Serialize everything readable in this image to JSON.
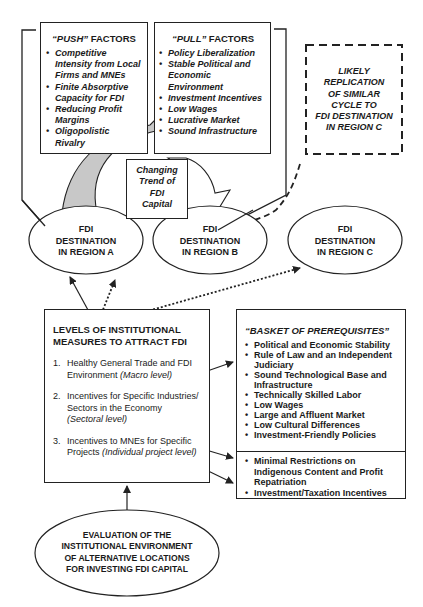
{
  "push": {
    "title_quoted": "“PUSH”",
    "title_rest": " FACTORS",
    "items": [
      "Competitive Intensity from Local Firms and MNEs",
      "Finite Absorptive Capacity for FDI",
      "Reducing Profit Margins",
      "Oligopolistic Rivalry"
    ]
  },
  "pull": {
    "title_quoted": "“PULL”",
    "title_rest": " FACTORS",
    "items": [
      "Policy Liberalization",
      "Stable Political and Economic Environment",
      "Investment Incentives",
      "Low Wages",
      "Lucrative Market",
      "Sound Infrastructure"
    ]
  },
  "replication_box": {
    "lines": [
      "LIKELY",
      "REPLICATION",
      "OF SIMILAR",
      "CYCLE TO",
      "FDI DESTINATION",
      "IN REGION C"
    ]
  },
  "trend_box": {
    "lines": [
      "Changing",
      "Trend of",
      "FDI",
      "Capital"
    ]
  },
  "destinations": [
    {
      "lines": [
        "FDI",
        "DESTINATION",
        "IN REGION A"
      ]
    },
    {
      "lines": [
        "FDI",
        "DESTINATION",
        "IN REGION B"
      ]
    },
    {
      "lines": [
        "FDI",
        "DESTINATION",
        "IN REGION C"
      ]
    }
  ],
  "levels": {
    "title_lines": [
      "LEVELS OF INSTITUTIONAL",
      "MEASURES TO ATTRACT FDI"
    ],
    "items": [
      {
        "num": "1.",
        "text": "Healthy General Trade and FDI Environment",
        "level": "(Macro level)"
      },
      {
        "num": "2.",
        "text": "Incentives for Specific Industries/ Sectors in the Economy",
        "level": "(Sectoral level)"
      },
      {
        "num": "3.",
        "text": "Incentives to MNEs for Specific Projects",
        "level": "(Individual project level)"
      }
    ]
  },
  "basket": {
    "title": "“BASKET OF PREREQUISITES”",
    "items": [
      "Political and Economic Stability",
      "Rule of Law and an Independent Judiciary",
      "Sound Technological Base and Infrastructure",
      "Technically Skilled Labor",
      "Low Wages",
      "Large and Affluent Market",
      "Low Cultural Differences",
      "Investment-Friendly Policies"
    ],
    "extra_items": [
      "Minimal Restrictions on Indigenous Content and Profit Repatriation",
      "Investment/Taxation Incentives"
    ]
  },
  "evaluation": {
    "lines": [
      "EVALUATION OF THE",
      "INSTITUTIONAL ENVIRONMENT",
      "OF ALTERNATIVE LOCATIONS",
      "FOR INVESTING FDI CAPITAL"
    ]
  }
}
